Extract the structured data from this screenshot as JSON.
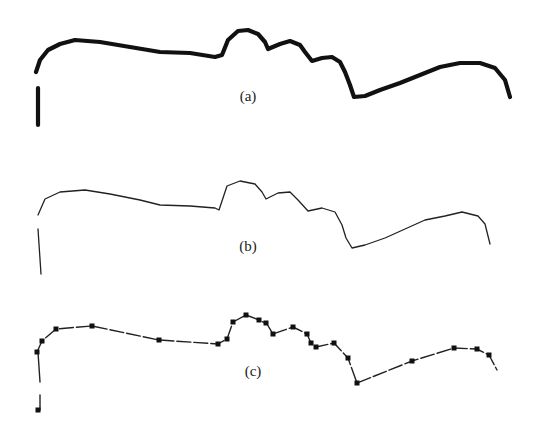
{
  "figure": {
    "panels": [
      {
        "id": "a",
        "label": "(a)",
        "style": "thick",
        "label_pos": [
          248,
          101
        ],
        "stem": [
          [
            38,
            125
          ],
          [
            38,
            88
          ]
        ],
        "points": [
          [
            36,
            72
          ],
          [
            40,
            60
          ],
          [
            48,
            50
          ],
          [
            60,
            44
          ],
          [
            75,
            40
          ],
          [
            100,
            42
          ],
          [
            130,
            47
          ],
          [
            160,
            52
          ],
          [
            190,
            53
          ],
          [
            215,
            57
          ],
          [
            222,
            55
          ],
          [
            228,
            40
          ],
          [
            238,
            31
          ],
          [
            248,
            30
          ],
          [
            258,
            34
          ],
          [
            265,
            42
          ],
          [
            268,
            49
          ],
          [
            280,
            44
          ],
          [
            290,
            41
          ],
          [
            300,
            45
          ],
          [
            305,
            52
          ],
          [
            312,
            61
          ],
          [
            322,
            58
          ],
          [
            332,
            57
          ],
          [
            340,
            62
          ],
          [
            345,
            72
          ],
          [
            350,
            85
          ],
          [
            354,
            97
          ],
          [
            365,
            96
          ],
          [
            380,
            90
          ],
          [
            400,
            83
          ],
          [
            420,
            75
          ],
          [
            440,
            67
          ],
          [
            460,
            63
          ],
          [
            480,
            63
          ],
          [
            495,
            68
          ],
          [
            505,
            80
          ],
          [
            510,
            97
          ]
        ]
      },
      {
        "id": "b",
        "label": "(b)",
        "style": "thin",
        "label_pos": [
          248,
          251
        ],
        "stem": [
          [
            38,
            229
          ],
          [
            41,
            274
          ]
        ],
        "points": [
          [
            38,
            215
          ],
          [
            45,
            199
          ],
          [
            60,
            192
          ],
          [
            85,
            190
          ],
          [
            110,
            194
          ],
          [
            140,
            200
          ],
          [
            160,
            205
          ],
          [
            190,
            206
          ],
          [
            215,
            208
          ],
          [
            219,
            210
          ],
          [
            227,
            186
          ],
          [
            240,
            181
          ],
          [
            255,
            184
          ],
          [
            262,
            192
          ],
          [
            266,
            199
          ],
          [
            278,
            193
          ],
          [
            290,
            192
          ],
          [
            298,
            200
          ],
          [
            308,
            211
          ],
          [
            322,
            208
          ],
          [
            335,
            212
          ],
          [
            342,
            225
          ],
          [
            346,
            238
          ],
          [
            352,
            248
          ],
          [
            365,
            245
          ],
          [
            385,
            238
          ],
          [
            405,
            229
          ],
          [
            425,
            220
          ],
          [
            445,
            216
          ],
          [
            462,
            212
          ],
          [
            478,
            216
          ],
          [
            485,
            224
          ],
          [
            490,
            244
          ]
        ]
      },
      {
        "id": "c",
        "label": "(c)",
        "style": "polyline-with-markers",
        "label_pos": [
          253,
          376
        ],
        "stem": [
          [
            38,
            352
          ],
          [
            40,
            382
          ]
        ],
        "stem_bottom": [
          [
            40,
            395
          ],
          [
            40,
            410
          ],
          [
            38,
            410
          ]
        ],
        "points": [
          [
            37,
            352
          ],
          [
            42,
            341
          ],
          [
            56,
            329
          ],
          [
            92,
            326
          ],
          [
            159,
            340
          ],
          [
            218,
            344
          ],
          [
            227,
            339
          ],
          [
            233,
            322
          ],
          [
            246,
            315
          ],
          [
            259,
            320
          ],
          [
            267,
            324
          ],
          [
            273,
            334
          ],
          [
            293,
            327
          ],
          [
            307,
            334
          ],
          [
            311,
            343
          ],
          [
            316,
            347
          ],
          [
            334,
            343
          ],
          [
            348,
            358
          ],
          [
            357,
            383
          ],
          [
            412,
            361
          ],
          [
            454,
            348
          ],
          [
            477,
            349
          ],
          [
            489,
            355
          ],
          [
            497,
            370
          ]
        ],
        "markers": [
          [
            37,
            352
          ],
          [
            42,
            341
          ],
          [
            56,
            329
          ],
          [
            92,
            326
          ],
          [
            159,
            340
          ],
          [
            218,
            344
          ],
          [
            227,
            339
          ],
          [
            233,
            322
          ],
          [
            246,
            315
          ],
          [
            259,
            320
          ],
          [
            266,
            323
          ],
          [
            273,
            334
          ],
          [
            293,
            327
          ],
          [
            307,
            334
          ],
          [
            311,
            343
          ],
          [
            316,
            347
          ],
          [
            334,
            343
          ],
          [
            348,
            358
          ],
          [
            357,
            383
          ],
          [
            412,
            361
          ],
          [
            454,
            348
          ],
          [
            477,
            349
          ],
          [
            489,
            355
          ],
          [
            38,
            410
          ]
        ]
      }
    ]
  }
}
